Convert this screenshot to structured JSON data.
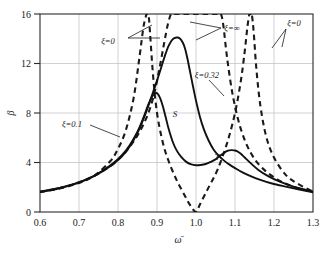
{
  "chart_data": {
    "type": "line",
    "title": "",
    "subtitle": "",
    "xlabel": "ω̄",
    "ylabel": "β",
    "xlim": [
      0.6,
      1.3
    ],
    "ylim": [
      0,
      16
    ],
    "xticks": [
      "0.6",
      "0.7",
      "0.8",
      "0.9",
      "1.0",
      "1.1",
      "1.2",
      "1.3"
    ],
    "xtick_values": [
      0.6,
      0.7,
      0.8,
      0.9,
      1.0,
      1.1,
      1.2,
      1.3
    ],
    "yticks": [
      "0",
      "4",
      "8",
      "12",
      "16"
    ],
    "ytick_values": [
      0,
      4,
      8,
      12,
      16
    ],
    "grid": true,
    "grid_color": "#bdbdbd",
    "legend_position": "inline-annotations",
    "series": [
      {
        "name": "ξ=0",
        "style": "dashed",
        "color": "#1a1a1a",
        "description": "Undamped absorber; two resonance asymptotes and antiresonance at 1.0",
        "x": [
          0.6,
          0.65,
          0.7,
          0.74,
          0.78,
          0.8,
          0.82,
          0.84,
          0.855,
          0.865,
          0.87,
          0.873,
          0.875,
          0.877,
          0.88,
          0.89,
          0.9,
          0.915,
          0.93,
          0.95,
          0.97,
          0.985,
          1.0,
          1.01,
          1.03,
          1.055,
          1.08,
          1.1,
          1.115,
          1.125,
          1.132,
          1.137,
          1.14,
          1.143,
          1.148,
          1.155,
          1.165,
          1.18,
          1.2,
          1.23,
          1.26,
          1.3
        ],
        "y": [
          1.62,
          1.9,
          2.35,
          2.95,
          4.1,
          5.1,
          6.6,
          9.2,
          12.5,
          14.9,
          15.6,
          16.0,
          16.0,
          16.0,
          15.4,
          11.0,
          8.0,
          5.6,
          4.1,
          2.6,
          1.4,
          0.55,
          0.0,
          0.6,
          1.85,
          3.4,
          5.6,
          8.0,
          10.6,
          13.0,
          15.0,
          16.0,
          16.0,
          16.0,
          14.5,
          11.5,
          8.6,
          6.1,
          4.4,
          3.0,
          2.3,
          1.65
        ]
      },
      {
        "name": "ξ=∞",
        "style": "dashed",
        "color": "#1a1a1a",
        "description": "Rigidly locked absorber; single resonance asymptote near 1.0",
        "x": [
          0.6,
          0.65,
          0.7,
          0.75,
          0.8,
          0.84,
          0.87,
          0.89,
          0.905,
          0.918,
          0.928,
          0.936,
          0.942,
          0.946,
          0.949,
          0.951,
          0.955,
          0.96,
          0.97,
          0.985,
          1.0,
          1.015,
          1.03,
          1.042,
          1.05,
          1.056,
          1.06,
          1.064,
          1.07,
          1.08,
          1.095,
          1.115,
          1.14,
          1.17,
          1.21,
          1.25,
          1.3
        ],
        "y": [
          1.62,
          1.92,
          2.4,
          3.1,
          4.2,
          5.7,
          7.4,
          9.2,
          11.4,
          13.6,
          15.2,
          16.0,
          16.0,
          16.0,
          16.0,
          16.0,
          16.0,
          16.0,
          16.0,
          16.0,
          16.0,
          16.0,
          16.0,
          16.0,
          16.0,
          16.0,
          16.0,
          16.0,
          15.1,
          12.4,
          9.3,
          6.7,
          4.8,
          3.55,
          2.6,
          2.05,
          1.6
        ]
      },
      {
        "name": "ξ=0.1",
        "style": "solid",
        "color": "#111111",
        "description": "Lightly damped absorber; twin peaks 9.6 at 0.90 and 5.0 at 1.10",
        "x": [
          0.6,
          0.65,
          0.7,
          0.74,
          0.78,
          0.81,
          0.83,
          0.85,
          0.865,
          0.878,
          0.888,
          0.896,
          0.902,
          0.908,
          0.915,
          0.922,
          0.93,
          0.94,
          0.95,
          0.962,
          0.975,
          0.988,
          1.0,
          1.012,
          1.025,
          1.038,
          1.05,
          1.062,
          1.072,
          1.082,
          1.09,
          1.098,
          1.105,
          1.115,
          1.125,
          1.14,
          1.16,
          1.185,
          1.215,
          1.25,
          1.3
        ],
        "y": [
          1.65,
          1.95,
          2.4,
          2.95,
          3.75,
          4.6,
          5.4,
          6.5,
          7.6,
          8.7,
          9.35,
          9.6,
          9.55,
          9.2,
          8.55,
          7.7,
          6.7,
          5.7,
          5.0,
          4.45,
          4.05,
          3.85,
          3.78,
          3.8,
          3.88,
          4.05,
          4.25,
          4.55,
          4.78,
          4.95,
          5.0,
          4.98,
          4.92,
          4.7,
          4.4,
          3.95,
          3.4,
          2.9,
          2.45,
          2.05,
          1.65
        ]
      },
      {
        "name": "ξ=0.32",
        "style": "solid",
        "color": "#111111",
        "description": "Optimally damped absorber; single peak 14.1 near 0.97",
        "x": [
          0.6,
          0.65,
          0.7,
          0.74,
          0.78,
          0.81,
          0.83,
          0.85,
          0.865,
          0.878,
          0.89,
          0.9,
          0.91,
          0.92,
          0.93,
          0.94,
          0.95,
          0.958,
          0.966,
          0.972,
          0.978,
          0.985,
          0.992,
          1.0,
          1.01,
          1.02,
          1.032,
          1.045,
          1.058,
          1.072,
          1.085,
          1.1,
          1.118,
          1.14,
          1.165,
          1.195,
          1.23,
          1.265,
          1.3
        ],
        "y": [
          1.62,
          1.92,
          2.38,
          2.92,
          3.7,
          4.5,
          5.3,
          6.4,
          7.5,
          8.6,
          9.7,
          10.6,
          11.6,
          12.6,
          13.45,
          13.95,
          14.1,
          14.05,
          13.7,
          13.2,
          12.4,
          11.3,
          10.2,
          9.0,
          7.7,
          6.7,
          5.8,
          5.05,
          4.55,
          4.15,
          3.85,
          3.55,
          3.22,
          2.9,
          2.6,
          2.3,
          2.05,
          1.82,
          1.6
        ]
      }
    ],
    "annotations": [
      {
        "name": "xi-zero-left-label",
        "text": "ξ=0",
        "x_px": 108,
        "y_px": 41
      },
      {
        "name": "xi-infinity-label",
        "text": "ξ=∞",
        "x_px": 224,
        "y_px": 28
      },
      {
        "name": "xi-zero-right-label",
        "text": "ξ=0",
        "x_px": 288,
        "y_px": 24
      },
      {
        "name": "xi-point32-label",
        "text": "ξ=0.32",
        "x_px": 210,
        "y_px": 75
      },
      {
        "name": "xi-point1-label",
        "text": "ξ=0.1",
        "x_px": 66,
        "y_px": 124
      }
    ],
    "fixed_points": [
      {
        "name": "point-S",
        "label": "S",
        "x": 0.913,
        "y": 8.35,
        "label_x_px": 175,
        "label_y_px": 115
      },
      {
        "name": "point-T",
        "label": "T",
        "x": 1.078,
        "y": 4.55,
        "label_x_px": 215,
        "label_y_px": 158
      }
    ]
  }
}
